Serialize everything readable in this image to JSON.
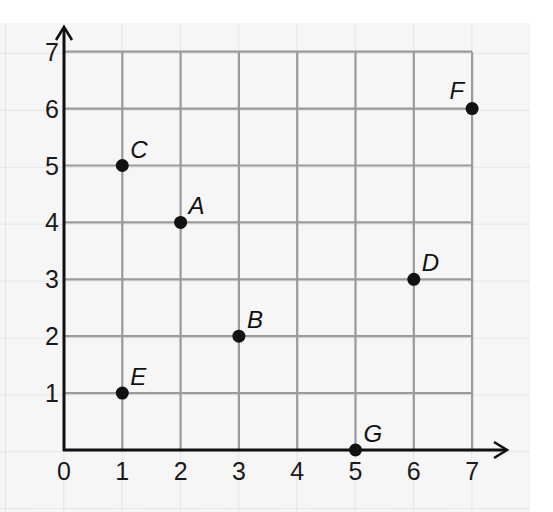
{
  "chart_data": {
    "type": "scatter",
    "title": "",
    "xlabel": "",
    "ylabel": "",
    "xlim": [
      0,
      7
    ],
    "ylim": [
      0,
      7
    ],
    "grid": true,
    "x_ticks": [
      "0",
      "1",
      "2",
      "3",
      "4",
      "5",
      "6",
      "7"
    ],
    "y_ticks": [
      "1",
      "2",
      "3",
      "4",
      "5",
      "6",
      "7"
    ],
    "points": [
      {
        "label": "A",
        "x": 2,
        "y": 4
      },
      {
        "label": "B",
        "x": 3,
        "y": 2
      },
      {
        "label": "C",
        "x": 1,
        "y": 5
      },
      {
        "label": "D",
        "x": 6,
        "y": 3
      },
      {
        "label": "E",
        "x": 1,
        "y": 1
      },
      {
        "label": "F",
        "x": 7,
        "y": 6
      },
      {
        "label": "G",
        "x": 5,
        "y": 0
      }
    ]
  },
  "colors": {
    "grid": "#9a9a9a",
    "axis": "#111111",
    "point": "#111111",
    "paper": "#f6f6f6"
  }
}
